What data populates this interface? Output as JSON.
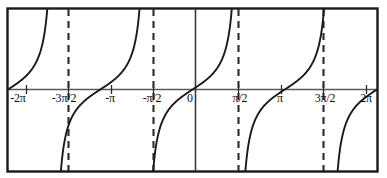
{
  "figure": {
    "title": "",
    "background_color": "#ffffff",
    "frame_color": "#1a1a1a",
    "axis_color": "#5a5a5a",
    "curve_color": "#1a1a1a",
    "asymptote_color": "#2b2b2b"
  },
  "chart_data": {
    "type": "line",
    "title": "",
    "xlabel": "",
    "ylabel": "",
    "function": "y = tan(x)",
    "xlim": [
      -6.283185307,
      6.283185307
    ],
    "ylim": [
      -4.2,
      4.2
    ],
    "grid": false,
    "legend": null,
    "x_tick_values": [
      -6.283185307,
      -4.71238898,
      -3.141592653,
      -1.570796327,
      0,
      1.570796327,
      3.141592653,
      4.71238898,
      6.283185307
    ],
    "x_tick_labels": [
      "-2π",
      "-3π/2",
      "-π",
      "-π/2",
      "0",
      "π/2",
      "π",
      "3π/2",
      "2π"
    ],
    "y_tick_values": [],
    "y_tick_labels": [],
    "asymptotes": {
      "style": "dashed",
      "x_values": [
        -4.71238898,
        -1.570796327,
        1.570796327,
        4.71238898
      ],
      "labels": [
        "-3π/2",
        "-π/2",
        "π/2",
        "3π/2"
      ]
    },
    "solid_vertical_lines": {
      "x_values": [
        0
      ],
      "labels": [
        "0"
      ]
    },
    "zero_crossings": {
      "x_values": [
        -6.283185307,
        -3.141592653,
        0,
        3.141592653,
        6.283185307
      ],
      "labels": [
        "-2π",
        "-π",
        "0",
        "π",
        "2π"
      ]
    },
    "branches": [
      {
        "name": "branch-1",
        "x_start": -6.283185307,
        "x_end": -4.71238898,
        "from": "0",
        "to": "+inf"
      },
      {
        "name": "branch-2",
        "x_start": -4.71238898,
        "x_end": -1.570796327,
        "from": "-inf",
        "to": "+inf"
      },
      {
        "name": "branch-3",
        "x_start": -1.570796327,
        "x_end": 1.570796327,
        "from": "-inf",
        "to": "+inf"
      },
      {
        "name": "branch-4",
        "x_start": 1.570796327,
        "x_end": 4.71238898,
        "from": "-inf",
        "to": "+inf"
      },
      {
        "name": "branch-5",
        "x_start": 4.71238898,
        "x_end": 6.283185307,
        "from": "-inf",
        "to": "0"
      }
    ]
  },
  "tick_labels": [
    {
      "text": "-2π",
      "x": 18,
      "y": 92
    },
    {
      "text": "-3π/2",
      "x": 64,
      "y": 92
    },
    {
      "text": "-π",
      "x": 110,
      "y": 92
    },
    {
      "text": "-π/2",
      "x": 152,
      "y": 92
    },
    {
      "text": "0",
      "x": 190,
      "y": 92
    },
    {
      "text": "π/2",
      "x": 240,
      "y": 92
    },
    {
      "text": "π",
      "x": 280,
      "y": 92
    },
    {
      "text": "3π/2",
      "x": 325,
      "y": 92
    },
    {
      "text": "2π",
      "x": 366,
      "y": 92
    }
  ]
}
